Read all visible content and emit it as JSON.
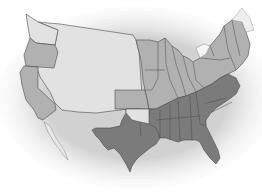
{
  "map": {
    "title": "United States regions map",
    "colors": {
      "background": "#ffffff",
      "territory": "#e2e2e2",
      "union": "#b1b1b1",
      "confederacy": "#7b7b7b",
      "border": "#4a4a4a",
      "water_shadow": "#c8c8c8"
    },
    "regions": [
      {
        "name": "territories",
        "fill_key": "territory"
      },
      {
        "name": "union",
        "fill_key": "union"
      },
      {
        "name": "confederacy",
        "fill_key": "confederacy"
      }
    ]
  }
}
